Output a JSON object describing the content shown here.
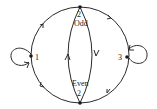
{
  "diagram": {
    "type": "state-transition-graph",
    "nodes": [
      {
        "id": "odd2",
        "label_num": "2",
        "label_text": "Odd"
      },
      {
        "id": "even2",
        "label_num": "2",
        "label_text": "Even"
      },
      {
        "id": "n1",
        "label": "1"
      },
      {
        "id": "n3",
        "label": "3"
      }
    ],
    "edges": [
      {
        "from": "n1",
        "to": "odd2"
      },
      {
        "from": "odd2",
        "to": "n3"
      },
      {
        "from": "n3",
        "to": "even2"
      },
      {
        "from": "even2",
        "to": "n1"
      },
      {
        "from": "even2",
        "to": "odd2",
        "side": "left-inner"
      },
      {
        "from": "odd2",
        "to": "even2",
        "side": "right-inner"
      },
      {
        "from": "n1",
        "to": "n1",
        "type": "self-loop"
      },
      {
        "from": "n3",
        "to": "n3",
        "type": "self-loop"
      }
    ],
    "colors": {
      "stroke": "#2a2a2a",
      "background": "#ffffff"
    }
  }
}
